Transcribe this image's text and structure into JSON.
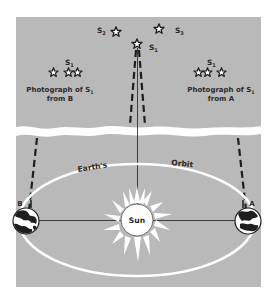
{
  "figure": {
    "colors": {
      "background": "#ffffff",
      "panel": "#b9b9b9",
      "orbit": "#ffffff",
      "ink": "#1e1e1e",
      "sun": "#ffffff"
    }
  },
  "stars": {
    "s1_label": "S",
    "s1_sub": "1",
    "s2_label": "S",
    "s2_sub": "2",
    "s3_label": "S",
    "s3_sub": "3"
  },
  "photo_b": {
    "star_label": "S",
    "star_sub": "1",
    "caption_line1": "Photograph of S",
    "caption_sub": "1",
    "caption_line2": "from B"
  },
  "photo_a": {
    "star_label": "S",
    "star_sub": "1",
    "caption_line1": "Photograph of S",
    "caption_sub": "1",
    "caption_line2": "from A"
  },
  "orbit": {
    "label_left": "Earth's",
    "label_right": "Orbit"
  },
  "sun": {
    "label": "Sun"
  },
  "earth_positions": {
    "left_label": "B",
    "right_label": "A"
  }
}
